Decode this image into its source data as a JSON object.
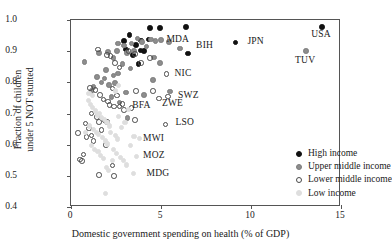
{
  "chart_data": {
    "type": "scatter",
    "title": "",
    "xlabel": "Domestic government spending on health (% of GDP)",
    "ylabel_line1": "Fraction of children",
    "ylabel_line2": "under 5 NOT stunted",
    "xlim": [
      0,
      15
    ],
    "ylim": [
      0.4,
      1.0
    ],
    "xticks": [
      0,
      5,
      10,
      15
    ],
    "xtick_labels": [
      "0",
      "5",
      "10",
      "15"
    ],
    "yticks": [
      0.4,
      0.5,
      0.6,
      0.7,
      0.8,
      0.9,
      1.0
    ],
    "ytick_labels": [
      "0.4",
      "0.5",
      "0.6",
      "0.7",
      "0.8",
      "0.9",
      "1.0"
    ],
    "grid": false,
    "legend_position": "center-right",
    "colors": {
      "high": "#111111",
      "upper": "#8d8d8d",
      "lower": "#4a4a4a",
      "low": "#dedede"
    },
    "legend": [
      {
        "key": "high",
        "label": "High income"
      },
      {
        "key": "upper",
        "label": "Upper middle income"
      },
      {
        "key": "lower",
        "label": "Lower middle income"
      },
      {
        "key": "low",
        "label": "Low income"
      }
    ],
    "annotations": [
      {
        "text": "MDA",
        "x": 5.3,
        "y": 0.935
      },
      {
        "text": "BIH",
        "x": 6.95,
        "y": 0.918
      },
      {
        "text": "JPN",
        "x": 9.8,
        "y": 0.928
      },
      {
        "text": "USA",
        "x": 13.35,
        "y": 0.952
      },
      {
        "text": "TUV",
        "x": 12.45,
        "y": 0.87
      },
      {
        "text": "NIC",
        "x": 5.75,
        "y": 0.827
      },
      {
        "text": "SWZ",
        "x": 5.95,
        "y": 0.757
      },
      {
        "text": "ZWE",
        "x": 5.05,
        "y": 0.73
      },
      {
        "text": "BFA",
        "x": 3.4,
        "y": 0.725
      },
      {
        "text": "LSO",
        "x": 5.8,
        "y": 0.668
      },
      {
        "text": "MWI",
        "x": 4.0,
        "y": 0.617
      },
      {
        "text": "MOZ",
        "x": 4.0,
        "y": 0.565
      },
      {
        "text": "MDG",
        "x": 4.2,
        "y": 0.505
      }
    ],
    "series": [
      {
        "name": "High income",
        "key": "high",
        "points": [
          [
            3.25,
            0.952
          ],
          [
            3.6,
            0.92
          ],
          [
            3.75,
            0.858
          ],
          [
            3.9,
            0.934
          ],
          [
            4.4,
            0.975
          ],
          [
            4.95,
            0.975
          ],
          [
            6.4,
            0.978
          ],
          [
            6.5,
            0.893
          ],
          [
            9.15,
            0.928
          ],
          [
            13.95,
            0.978
          ],
          [
            3.05,
            0.905
          ],
          [
            3.45,
            0.888
          ],
          [
            4.05,
            0.9
          ],
          [
            4.3,
            0.938
          ],
          [
            2.95,
            0.932
          ],
          [
            3.85,
            0.902
          ]
        ]
      },
      {
        "name": "Upper middle income",
        "key": "upper",
        "points": [
          [
            0.75,
            0.865
          ],
          [
            1.55,
            0.895
          ],
          [
            2.05,
            0.898
          ],
          [
            2.35,
            0.878
          ],
          [
            2.55,
            0.9
          ],
          [
            2.6,
            0.925
          ],
          [
            2.95,
            0.918
          ],
          [
            3.1,
            0.895
          ],
          [
            3.35,
            0.925
          ],
          [
            3.5,
            0.9
          ],
          [
            3.7,
            0.94
          ],
          [
            3.95,
            0.93
          ],
          [
            4.2,
            0.915
          ],
          [
            4.45,
            0.938
          ],
          [
            4.7,
            0.932
          ],
          [
            5.0,
            0.935
          ],
          [
            5.45,
            0.93
          ],
          [
            6.05,
            0.908
          ],
          [
            4.6,
            0.88
          ],
          [
            4.95,
            0.862
          ],
          [
            13.05,
            0.9
          ],
          [
            1.45,
            0.818
          ],
          [
            1.7,
            0.8
          ],
          [
            1.85,
            0.812
          ],
          [
            2.1,
            0.792
          ],
          [
            2.35,
            0.822
          ],
          [
            2.45,
            0.798
          ],
          [
            2.6,
            0.828
          ],
          [
            1.25,
            0.785
          ],
          [
            1.15,
            0.772
          ],
          [
            4.55,
            0.807
          ],
          [
            4.05,
            0.76
          ],
          [
            5.5,
            0.77
          ],
          [
            3.05,
            0.768
          ],
          [
            3.15,
            0.685
          ],
          [
            2.7,
            0.735
          ],
          [
            2.25,
            0.752
          ],
          [
            1.95,
            0.84
          ],
          [
            2.85,
            0.858
          ],
          [
            3.3,
            0.845
          ]
        ]
      },
      {
        "name": "Lower middle income",
        "key": "lower",
        "points": [
          [
            1.5,
            0.905
          ],
          [
            2.0,
            0.888
          ],
          [
            2.2,
            0.885
          ],
          [
            2.45,
            0.862
          ],
          [
            2.7,
            0.848
          ],
          [
            3.2,
            0.9
          ],
          [
            3.55,
            0.89
          ],
          [
            3.9,
            0.862
          ],
          [
            4.4,
            0.878
          ],
          [
            5.3,
            0.827
          ],
          [
            1.05,
            0.782
          ],
          [
            1.35,
            0.775
          ],
          [
            1.6,
            0.76
          ],
          [
            2.3,
            0.78
          ],
          [
            2.55,
            0.758
          ],
          [
            2.15,
            0.728
          ],
          [
            2.4,
            0.722
          ],
          [
            2.05,
            0.738
          ],
          [
            1.8,
            0.745
          ],
          [
            3.6,
            0.772
          ],
          [
            4.55,
            0.772
          ],
          [
            4.9,
            0.748
          ],
          [
            5.4,
            0.755
          ],
          [
            3.35,
            0.718
          ],
          [
            1.15,
            0.7
          ],
          [
            1.45,
            0.688
          ],
          [
            1.55,
            0.672
          ],
          [
            1.85,
            0.678
          ],
          [
            0.8,
            0.668
          ],
          [
            1.0,
            0.652
          ],
          [
            0.4,
            0.638
          ],
          [
            0.85,
            0.625
          ],
          [
            1.15,
            0.63
          ],
          [
            2.0,
            0.672
          ],
          [
            3.55,
            0.68
          ],
          [
            5.25,
            0.665
          ],
          [
            1.95,
            0.598
          ],
          [
            0.5,
            0.552
          ],
          [
            0.6,
            0.548
          ],
          [
            0.7,
            0.568
          ],
          [
            1.55,
            0.502
          ],
          [
            2.3,
            0.533
          ],
          [
            2.4,
            0.5
          ],
          [
            1.25,
            0.612
          ],
          [
            1.7,
            0.648
          ],
          [
            2.7,
            0.722
          ],
          [
            2.85,
            0.73
          ],
          [
            2.95,
            0.712
          ]
        ]
      },
      {
        "name": "Low income",
        "key": "low",
        "points": [
          [
            0.95,
            0.742
          ],
          [
            1.1,
            0.73
          ],
          [
            1.2,
            0.718
          ],
          [
            1.35,
            0.708
          ],
          [
            1.45,
            0.695
          ],
          [
            1.6,
            0.7
          ],
          [
            1.7,
            0.688
          ],
          [
            1.85,
            0.682
          ],
          [
            2.0,
            0.672
          ],
          [
            2.15,
            0.66
          ],
          [
            1.05,
            0.66
          ],
          [
            1.25,
            0.648
          ],
          [
            1.4,
            0.64
          ],
          [
            1.55,
            0.632
          ],
          [
            1.75,
            0.622
          ],
          [
            1.9,
            0.612
          ],
          [
            2.05,
            0.602
          ],
          [
            2.2,
            0.64
          ],
          [
            2.45,
            0.63
          ],
          [
            2.6,
            0.618
          ],
          [
            1.15,
            0.598
          ],
          [
            1.3,
            0.585
          ],
          [
            1.5,
            0.578
          ],
          [
            1.65,
            0.565
          ],
          [
            1.8,
            0.555
          ],
          [
            2.35,
            0.585
          ],
          [
            2.55,
            0.572
          ],
          [
            2.75,
            0.56
          ],
          [
            2.9,
            0.548
          ],
          [
            3.1,
            0.535
          ],
          [
            1.95,
            0.528
          ],
          [
            2.1,
            0.518
          ],
          [
            2.3,
            0.548
          ],
          [
            1.9,
            0.442
          ],
          [
            3.3,
            0.598
          ],
          [
            3.5,
            0.625
          ],
          [
            2.8,
            0.655
          ],
          [
            3.0,
            0.67
          ],
          [
            2.65,
            0.69
          ],
          [
            3.2,
            0.712
          ],
          [
            1.0,
            0.765
          ],
          [
            1.2,
            0.758
          ],
          [
            2.45,
            0.772
          ],
          [
            2.65,
            0.79
          ],
          [
            3.45,
            0.508
          ],
          [
            3.65,
            0.562
          ],
          [
            3.8,
            0.62
          ],
          [
            0.8,
            0.638
          ]
        ]
      }
    ]
  }
}
